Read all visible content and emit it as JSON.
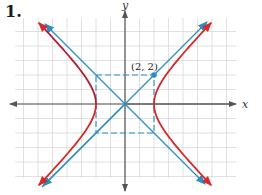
{
  "problem_number": "1.",
  "chart_data": {
    "type": "line",
    "title": "",
    "equation": "x^2/4 - y^2/4 = 1",
    "xlabel": "x",
    "ylabel": "y",
    "xlim": [
      -8,
      8
    ],
    "ylim": [
      -6,
      6
    ],
    "grid": true,
    "grid_step": 1,
    "annotations": [
      {
        "text": "(2, 2)",
        "x": 2,
        "y": 2
      }
    ],
    "reference_box": {
      "corners": [
        [
          -2,
          2
        ],
        [
          2,
          2
        ],
        [
          2,
          -2
        ],
        [
          -2,
          -2
        ]
      ],
      "style": "dashed"
    },
    "vertices": [
      [
        -2,
        0
      ],
      [
        2,
        0
      ]
    ],
    "series": [
      {
        "name": "hyperbola-right-branch",
        "color": "#d42a2a",
        "kind": "curve"
      },
      {
        "name": "hyperbola-left-branch",
        "color": "#d42a2a",
        "kind": "curve"
      },
      {
        "name": "asymptote y = x",
        "color": "#2a8fc4",
        "kind": "line",
        "slope": 1
      },
      {
        "name": "asymptote y = -x",
        "color": "#2a8fc4",
        "kind": "line",
        "slope": -1
      }
    ]
  },
  "labels": {
    "x_axis": "x",
    "y_axis": "y",
    "point": "(2, 2)"
  },
  "colors": {
    "curve": "#d42a2a",
    "asymptote": "#2a8fc4",
    "axis": "#555555",
    "grid": "#d8d8d8"
  }
}
